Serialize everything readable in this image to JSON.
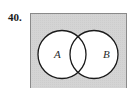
{
  "problem": {
    "number_label": "40."
  },
  "diagram": {
    "type": "venn",
    "shaded_region": "complement of A union B",
    "universe": {
      "x": 30.5,
      "y": 13.5,
      "width": 96,
      "height": 80,
      "fill": "#d3d3d3",
      "stroke": "#8a8a8a"
    },
    "circles": [
      {
        "label": "A",
        "cx": 62,
        "cy": 54.5,
        "r": 24,
        "fill": "#ffffff",
        "stroke": "#1a1a1a",
        "label_x": 54,
        "label_y": 58
      },
      {
        "label": "B",
        "cx": 94,
        "cy": 54.5,
        "r": 24,
        "fill": "#ffffff",
        "stroke": "#1a1a1a",
        "label_x": 103,
        "label_y": 58
      }
    ]
  }
}
